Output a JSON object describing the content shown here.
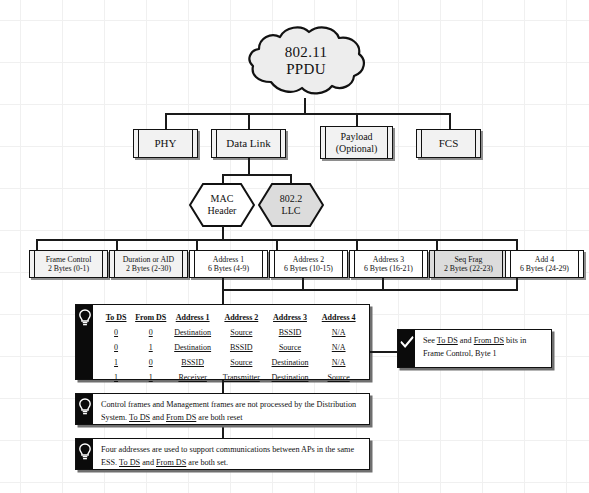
{
  "diagram": {
    "root": {
      "line1": "802.11",
      "line2": "PPDU"
    },
    "layer_boxes": [
      {
        "id": "phy",
        "label": "PHY"
      },
      {
        "id": "data-link",
        "label": "Data Link"
      },
      {
        "id": "payload",
        "line1": "Payload",
        "line2": "(Optional)"
      },
      {
        "id": "fcs",
        "label": "FCS"
      }
    ],
    "hexagons": [
      {
        "id": "mac-header",
        "line1": "MAC",
        "line2": "Header",
        "fill": "#ffffff"
      },
      {
        "id": "llc",
        "line1": "802.2",
        "line2": "LLC",
        "fill": "#dcdcdc"
      }
    ],
    "mac_fields": [
      {
        "id": "frame-control",
        "name": "Frame Control",
        "size": "2 Bytes (0-1)",
        "fill": "#f2f2f2"
      },
      {
        "id": "duration-aid",
        "name": "Duration or AID",
        "size": "2 Bytes  (2-30)",
        "fill": "#f2f2f2"
      },
      {
        "id": "address-1",
        "name": "Address 1",
        "size": "6 Bytes (4-9)",
        "fill": "#ffffff"
      },
      {
        "id": "address-2",
        "name": "Address 2",
        "size": "6 Bytes (10-15)",
        "fill": "#ffffff"
      },
      {
        "id": "address-3",
        "name": "Address 3",
        "size": "6 Bytes (16-21)",
        "fill": "#ffffff"
      },
      {
        "id": "seq-frag",
        "name": "Seq Frag",
        "size": "2 Bytes (22-23)",
        "fill": "#dcdcdc"
      },
      {
        "id": "add-4",
        "name": "Add 4",
        "size": "6 Bytes (24-29)",
        "fill": "#ffffff"
      }
    ],
    "address_table": {
      "headers": [
        "To DS",
        "From DS",
        "Address 1",
        "Address 2",
        "Address 3",
        "Address 4"
      ],
      "rows": [
        [
          "0",
          "0",
          "Destination",
          "Source",
          "BSSID",
          "N/A"
        ],
        [
          "0",
          "1",
          "Destination",
          "BSSID",
          "Source",
          "N/A"
        ],
        [
          "1",
          "0",
          "BSSID",
          "Source",
          "Destination",
          "N/A"
        ],
        [
          "1",
          "1",
          "Receiver",
          "Transmitter",
          "Destination",
          "Source"
        ]
      ]
    },
    "notes": {
      "check_note": {
        "icon": "check-icon",
        "segments": [
          {
            "text": "See ",
            "underline": false
          },
          {
            "text": "To DS",
            "underline": true
          },
          {
            "text": " and ",
            "underline": false
          },
          {
            "text": "From DS",
            "underline": true
          },
          {
            "text": " bits in Frame Control, Byte 1",
            "underline": false
          }
        ],
        "plain": "See To DS and From DS bits in Frame Control, Byte 1"
      },
      "note_control": {
        "icon": "lightbulb-icon",
        "segments": [
          {
            "text": "Control frames and Management frames are not processed by the Distribution System.  ",
            "underline": false
          },
          {
            "text": "To DS",
            "underline": true
          },
          {
            "text": " and ",
            "underline": false
          },
          {
            "text": "From DS",
            "underline": true
          },
          {
            "text": " are both reset",
            "underline": false
          }
        ],
        "plain": "Control frames and Management frames are not processed by the Distribution System. To DS and From DS are both reset"
      },
      "note_four_addresses": {
        "icon": "lightbulb-icon",
        "segments": [
          {
            "text": "Four addresses are used to support communications between APs in the same ESS.  ",
            "underline": false
          },
          {
            "text": "To DS",
            "underline": true
          },
          {
            "text": " and ",
            "underline": false
          },
          {
            "text": "From DS",
            "underline": true
          },
          {
            "text": " are both set.",
            "underline": false
          }
        ],
        "plain": "Four addresses are used to support communications between APs in the same ESS. To DS and From DS are both set."
      }
    },
    "colors": {
      "line": "#1a1a1a",
      "box_fill": "#f2f2f2",
      "box_fill_gray": "#dcdcdc",
      "box_fill_white": "#ffffff",
      "note_bar": "#0b0b0b",
      "shadow": "#8e8e8e"
    }
  }
}
